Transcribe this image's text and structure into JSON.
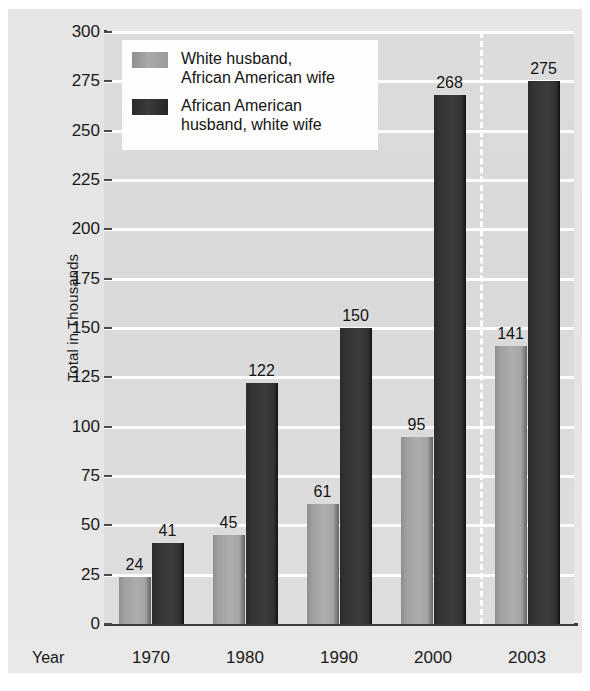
{
  "chart_data": {
    "type": "bar",
    "title": "",
    "subtitle": "",
    "xlabel": "Year",
    "ylabel": "Total in Thousands",
    "categories": [
      "1970",
      "1980",
      "1990",
      "2000",
      "2003"
    ],
    "series": [
      {
        "name": "White husband, African American wife",
        "name_line1": "White husband,",
        "name_line2": "African American wife",
        "color": "#a6a6a6",
        "values": [
          24,
          45,
          61,
          95,
          141
        ]
      },
      {
        "name": "African American husband, white wife",
        "name_line1": "African American",
        "name_line2": "husband, white wife",
        "color": "#333333",
        "values": [
          41,
          122,
          150,
          268,
          275
        ]
      }
    ],
    "ylim": [
      0,
      300
    ],
    "ytick_step": 25,
    "yticks": [
      "300",
      "275",
      "250",
      "225",
      "200",
      "175",
      "150",
      "125",
      "100",
      "75",
      "50",
      "25",
      "0"
    ],
    "grid": true,
    "gridline_color": "#ffffff",
    "plot_background": "#dadada",
    "canvas_background": "#e5e5e5",
    "legend_position": "top-left",
    "annotations": [
      {
        "type": "dashed-vertical-line",
        "between": [
          "2000",
          "2003"
        ],
        "color": "#ffffff"
      }
    ]
  }
}
